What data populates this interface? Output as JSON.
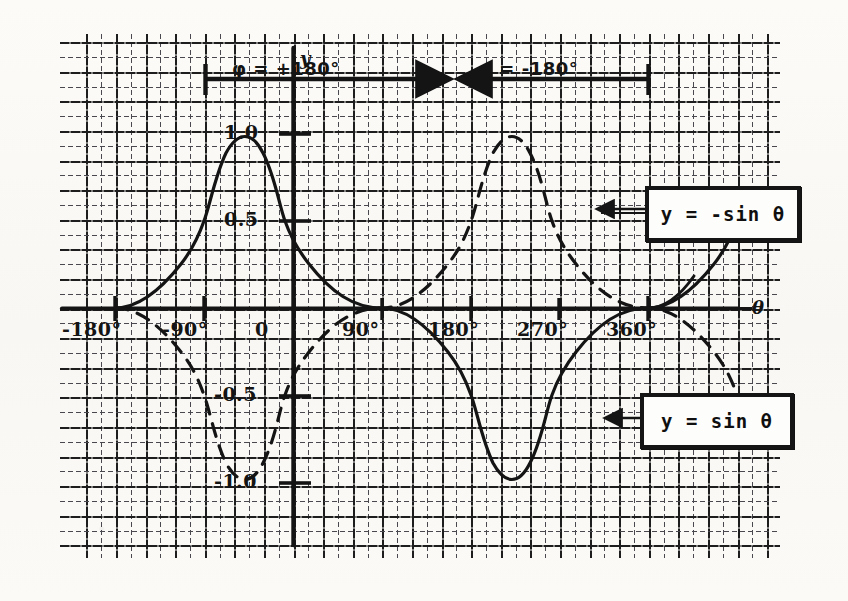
{
  "figure": {
    "kind": "hand-drawn graph on engineering grid paper",
    "x_axis_name": "θ",
    "y_axis_name": "y"
  },
  "axes": {
    "x_ticks": [
      "-180°",
      "-90°",
      "0",
      "90°",
      "180°",
      "270°",
      "360°"
    ],
    "x_tick_values": [
      -180,
      -90,
      0,
      90,
      180,
      270,
      360
    ],
    "y_ticks": [
      "1.0",
      "0.5",
      "-0.5",
      "-1.0"
    ],
    "y_tick_values": [
      1.0,
      0.5,
      -0.5,
      -1.0
    ]
  },
  "phase_bar": {
    "left_label": "φ = +180°",
    "right_label": "φ = -180°",
    "left_span_from": -90,
    "left_span_to": 90,
    "right_span_from": 90,
    "right_span_to": 270
  },
  "callouts": [
    {
      "name": "neg-sine-callout",
      "text": "y = -sin θ"
    },
    {
      "name": "pos-sine-callout",
      "text": "y = sin θ"
    }
  ],
  "chart_data": {
    "type": "line",
    "title": "",
    "xlabel": "θ",
    "ylabel": "y",
    "xlim": [
      -210,
      390
    ],
    "ylim": [
      -1.3,
      1.3
    ],
    "grid": true,
    "legend_position": "in-plot callout boxes",
    "annotations": [
      "φ = +180° (span -90° to 90°)",
      "φ = -180° (span 90° to 270°)",
      "y = -sin θ labels the solid curve",
      "y = sin θ labels the dashed curve"
    ],
    "xticks": [
      -180,
      -90,
      0,
      90,
      180,
      270,
      360
    ],
    "xticklabels": [
      "-180°",
      "-90°",
      "0",
      "90°",
      "180°",
      "270°",
      "360°"
    ],
    "yticks": [
      1.0,
      0.5,
      -0.5,
      -1.0
    ],
    "yticklabels": [
      "1.0",
      "0.5",
      "-0.5",
      "-1.0"
    ],
    "series": [
      {
        "name": "y = -sin θ",
        "style": "solid",
        "x": [
          -180,
          -157.5,
          -135,
          -112.5,
          -90,
          -67.5,
          -45,
          -22.5,
          0,
          22.5,
          45,
          67.5,
          90,
          112.5,
          135,
          157.5,
          180,
          202.5,
          225,
          247.5,
          270,
          292.5,
          315,
          337.5,
          360
        ],
        "y": [
          0,
          0.383,
          0.707,
          0.924,
          1.0,
          0.924,
          0.707,
          0.383,
          0,
          -0.383,
          -0.707,
          -0.924,
          -1.0,
          -0.924,
          -0.707,
          -0.383,
          0,
          0.383,
          0.707,
          0.924,
          1.0,
          0.924,
          0.707,
          0.383,
          0
        ]
      },
      {
        "name": "y = sin θ",
        "style": "dashed",
        "x": [
          -180,
          -157.5,
          -135,
          -112.5,
          -90,
          -67.5,
          -45,
          -22.5,
          0,
          22.5,
          45,
          67.5,
          90,
          112.5,
          135,
          157.5,
          180,
          202.5,
          225,
          247.5,
          270,
          292.5,
          315,
          337.5,
          360
        ],
        "y": [
          0,
          -0.383,
          -0.707,
          -0.924,
          -1.0,
          -0.924,
          -0.707,
          -0.383,
          0,
          0.383,
          0.707,
          0.924,
          1.0,
          0.924,
          0.707,
          0.383,
          0,
          -0.383,
          -0.707,
          -0.924,
          -1.0,
          -0.924,
          -0.707,
          -0.383,
          0
        ]
      }
    ]
  },
  "colors": {
    "ink": "#141414",
    "grid_major": "#1d1d1d",
    "grid_minor": "#4a484f",
    "paper": "#fbfaf7"
  }
}
